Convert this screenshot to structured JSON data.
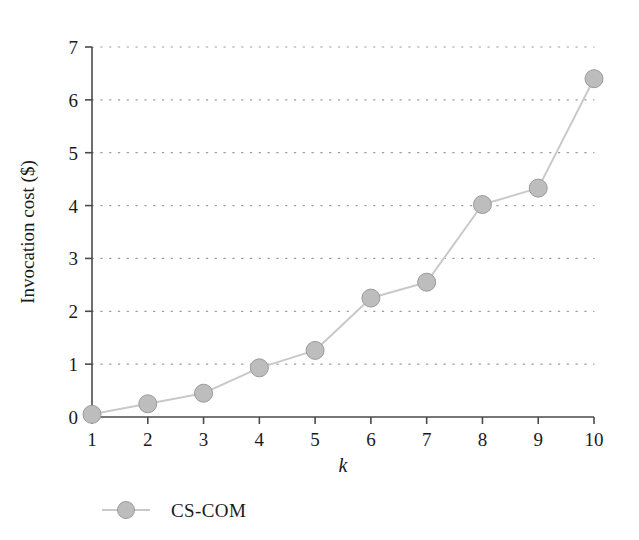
{
  "chart_data": {
    "type": "line",
    "title": "",
    "xlabel": "k",
    "ylabel": "Invocation cost ($)",
    "x": [
      1,
      2,
      3,
      4,
      5,
      6,
      7,
      8,
      9,
      10
    ],
    "xtick_labels": [
      "1",
      "2",
      "3",
      "4",
      "5",
      "6",
      "7",
      "8",
      "9",
      "10"
    ],
    "ytick_labels": [
      "0",
      "1",
      "2",
      "3",
      "4",
      "5",
      "6",
      "7"
    ],
    "yticks": [
      0,
      1,
      2,
      3,
      4,
      5,
      6,
      7
    ],
    "xlim": [
      1,
      10
    ],
    "ylim": [
      0,
      7
    ],
    "grid": "horizontal-dotted",
    "legend_position": "below-left",
    "series": [
      {
        "name": "CS-COM",
        "values": [
          0.05,
          0.25,
          0.45,
          0.93,
          1.26,
          2.25,
          2.55,
          4.02,
          4.33,
          6.4
        ],
        "marker": "circle",
        "line_color": "#c9c9c9",
        "marker_face_color": "#bdbdbd",
        "marker_edge_color": "#9a9a9a"
      }
    ],
    "colors": {
      "axis": "#4a4a4a",
      "grid": "#9c9c9c",
      "text": "#1a1a1a",
      "background": "#ffffff"
    }
  },
  "legend": {
    "entries": [
      {
        "label": "CS-COM"
      }
    ]
  }
}
